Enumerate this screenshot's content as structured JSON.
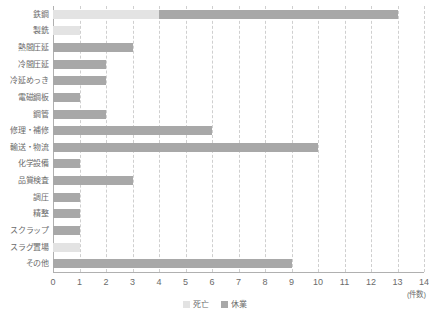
{
  "chart_data": {
    "type": "bar",
    "orientation": "horizontal",
    "stacked": true,
    "title": "",
    "xlabel": "(件数)",
    "ylabel": "",
    "xlim": [
      0,
      14
    ],
    "xticks": [
      "0",
      "1",
      "2",
      "3",
      "4",
      "5",
      "6",
      "7",
      "8",
      "9",
      "10",
      "11",
      "12",
      "13",
      "14"
    ],
    "grid": true,
    "legend_position": "bottom-center",
    "categories": [
      "鉄鋼",
      "製銑",
      "熱間圧延",
      "冷間圧延",
      "冷延めっき",
      "電磁鋼板",
      "鋼管",
      "修理・補修",
      "輸送・物流",
      "化学設備",
      "品質検査",
      "調圧",
      "精整",
      "スクラップ",
      "スラグ置場",
      "その他"
    ],
    "series": [
      {
        "name": "死亡",
        "color": "#e3e3e3",
        "values": [
          4,
          1,
          0,
          0,
          0,
          0,
          0,
          0,
          0,
          0,
          0,
          0,
          0,
          0,
          1,
          0
        ]
      },
      {
        "name": "休業",
        "color": "#a8a8a8",
        "values": [
          9,
          0,
          3,
          2,
          2,
          1,
          2,
          6,
          10,
          1,
          3,
          1,
          1,
          1,
          0,
          9
        ]
      }
    ],
    "totals": [
      13,
      1,
      3,
      2,
      2,
      1,
      2,
      6,
      10,
      1,
      3,
      1,
      1,
      1,
      1,
      9
    ]
  },
  "legend": {
    "items": [
      {
        "label": "死亡",
        "color": "#e3e3e3"
      },
      {
        "label": "休業",
        "color": "#a8a8a8"
      }
    ]
  },
  "axis": {
    "unit_label": "(件数)"
  }
}
